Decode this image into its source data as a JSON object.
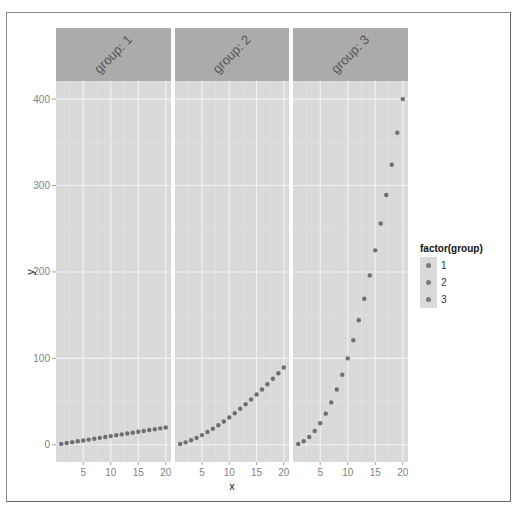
{
  "chart_data": {
    "type": "scatter",
    "title": "",
    "xlabel": "x",
    "ylabel": "y",
    "facet_variable": "group",
    "facets": [
      {
        "label": "group: 1",
        "x": [
          1,
          2,
          3,
          4,
          5,
          6,
          7,
          8,
          9,
          10,
          11,
          12,
          13,
          14,
          15,
          16,
          17,
          18,
          19,
          20
        ],
        "y": [
          1,
          2,
          3,
          4,
          5,
          6,
          7,
          8,
          9,
          10,
          11,
          12,
          13,
          14,
          15,
          16,
          17,
          18,
          19,
          20
        ]
      },
      {
        "label": "group: 2",
        "x": [
          1,
          2,
          3,
          4,
          5,
          6,
          7,
          8,
          9,
          10,
          11,
          12,
          13,
          14,
          15,
          16,
          17,
          18,
          19,
          20
        ],
        "y": [
          1,
          2.8,
          5.2,
          8,
          11.2,
          14.7,
          18.5,
          22.6,
          27,
          31.6,
          36.5,
          41.6,
          46.9,
          52.4,
          58.1,
          64,
          70.1,
          76.4,
          82.8,
          89.4
        ]
      },
      {
        "label": "group: 3",
        "x": [
          1,
          2,
          3,
          4,
          5,
          6,
          7,
          8,
          9,
          10,
          11,
          12,
          13,
          14,
          15,
          16,
          17,
          18,
          19,
          20
        ],
        "y": [
          1,
          4,
          9,
          16,
          25,
          36,
          49,
          64,
          81,
          100,
          121,
          144,
          169,
          196,
          225,
          256,
          289,
          324,
          361,
          400
        ]
      }
    ],
    "x_ticks": [
      5,
      10,
      15,
      20
    ],
    "y_ticks": [
      0,
      100,
      200,
      300,
      400
    ],
    "xlim": [
      0.05,
      20.95
    ],
    "ylim": [
      -19.95,
      420.95
    ],
    "grid": true,
    "legend": {
      "title": "factor(group)",
      "entries": [
        "1",
        "2",
        "3"
      ],
      "position": "right"
    }
  },
  "labels": {
    "x_axis": "x",
    "y_axis": "y",
    "legend_title": "factor(group)",
    "legend_items": [
      "1",
      "2",
      "3"
    ],
    "strips": [
      "group: 1",
      "group: 2",
      "group: 3"
    ],
    "x_ticks": [
      "5",
      "10",
      "15",
      "20"
    ],
    "y_ticks": [
      "0",
      "100",
      "200",
      "300",
      "400"
    ]
  },
  "colors": {
    "panel_bg": "#d9d9d9",
    "strip_bg": "#ababab",
    "grid_major": "#f2f2f2",
    "grid_minor": "#e6e6e6",
    "point": "#6e6e6e",
    "axis_text": "#7f7f7f"
  }
}
